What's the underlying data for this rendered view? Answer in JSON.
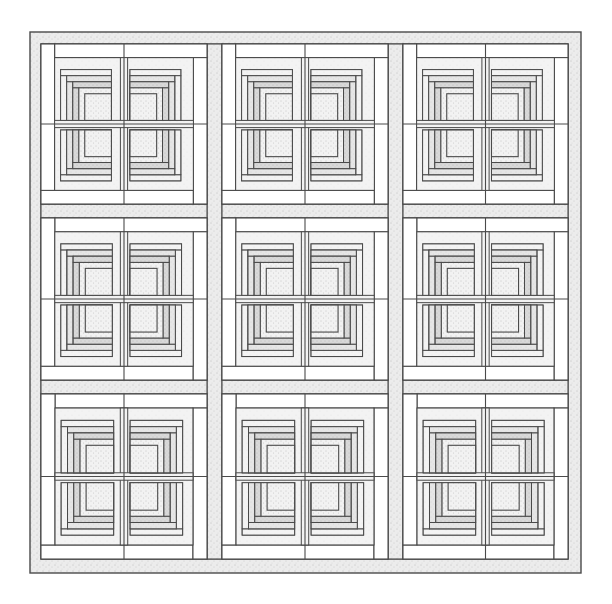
{
  "figure": {
    "subject": "Log cabin quilt layout",
    "canvas": {
      "width": 612,
      "height": 604,
      "background": "#ffffff"
    },
    "quilt": {
      "x": 30,
      "y": 32,
      "width": 551,
      "height": 541
    },
    "border": {
      "top_height": 12,
      "bottom_height": 14,
      "left_width": 11,
      "right_width": 13,
      "fill": "fabric-dotted-medium"
    },
    "grid": {
      "rows": 3,
      "cols": 3,
      "col_x": [
        [
          41,
          207
        ],
        [
          222,
          388
        ],
        [
          403,
          568
        ]
      ],
      "row_y": [
        [
          44,
          204
        ],
        [
          218,
          380
        ],
        [
          394,
          559
        ]
      ],
      "sashing_fill": "fabric-dotted-medium"
    },
    "block": {
      "name": "Log cabin block (4 mini blocks)",
      "outer_frame_ratio": 0.085,
      "outer_frame_fill": "#ffffff",
      "second_frame_ratio": 0.075,
      "second_frame_fill": "fabric-speckle-light",
      "center_strip_ratio": 0.045,
      "center_strip_fill": "fabric-speckle-light"
    },
    "mini_block": {
      "rings": [
        {
          "inset": 0.0,
          "fill": "fabric-speckle-light"
        },
        {
          "inset": 0.15,
          "fill": "fabric-speckle-medium"
        },
        {
          "inset": 0.32,
          "fill": "fabric-speckle-dark"
        },
        {
          "inset": 0.44,
          "fill": "fabric-dotted-center"
        }
      ],
      "log_width_ratio": 0.12
    },
    "palette": {
      "line": "#4a4a4a",
      "white": "#ffffff",
      "speckle_light": "#f1f1f1",
      "speckle_medium": "#e4e4e4",
      "speckle_dark": "#d6d6d6",
      "dotted": "#ececec",
      "dot": "#9a9a9a"
    }
  }
}
